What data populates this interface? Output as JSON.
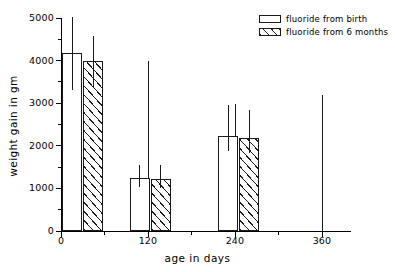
{
  "chart_data": {
    "type": "bar",
    "title": "",
    "xlabel": "age in days",
    "ylabel": "weight gain in gm",
    "xlim": [
      0,
      400
    ],
    "ylim": [
      0,
      5000
    ],
    "xticks": [
      0,
      120,
      240,
      360
    ],
    "xticks_minor": [
      60,
      180,
      300
    ],
    "yticks": [
      0,
      1000,
      2000,
      3000,
      4000,
      5000
    ],
    "yticks_minor": [
      500,
      1500,
      2500,
      3500,
      4500
    ],
    "grid": false,
    "legend_position": "top-right",
    "categories": [
      "30",
      "120",
      "240"
    ],
    "series": [
      {
        "name": "fluoride from birth",
        "fill": "white",
        "values": [
          4180,
          1250,
          2230
        ],
        "err_high": [
          5030,
          1550,
          2960
        ],
        "err_low": [
          3320,
          1030,
          1870
        ]
      },
      {
        "name": "fluoride from 6 months",
        "fill": "hatched",
        "values": [
          4000,
          1230,
          2180
        ],
        "err_high": [
          4570,
          1560,
          2830
        ],
        "err_low": [
          3390,
          1020,
          1830
        ]
      }
    ],
    "marker_lines": [
      {
        "x": 120,
        "top": 4000
      },
      {
        "x": 240,
        "top": 2980
      },
      {
        "x": 360,
        "top": 3200
      }
    ]
  },
  "axes": {
    "y_title": "weight gain in gm",
    "x_title": "age in days",
    "y_tick_labels": [
      "0",
      "1000",
      "2000",
      "3000",
      "4000",
      "5000"
    ],
    "x_tick_labels": [
      "0",
      "120",
      "240",
      "360"
    ]
  },
  "legend": {
    "items": [
      {
        "label": "fluoride from birth",
        "swatch": "open-rect-swatch"
      },
      {
        "label": "fluoride from 6 months",
        "swatch": "hatched-rect-swatch"
      }
    ]
  },
  "colors": {
    "ink": "#1a1a1a",
    "background": "#ffffff"
  }
}
